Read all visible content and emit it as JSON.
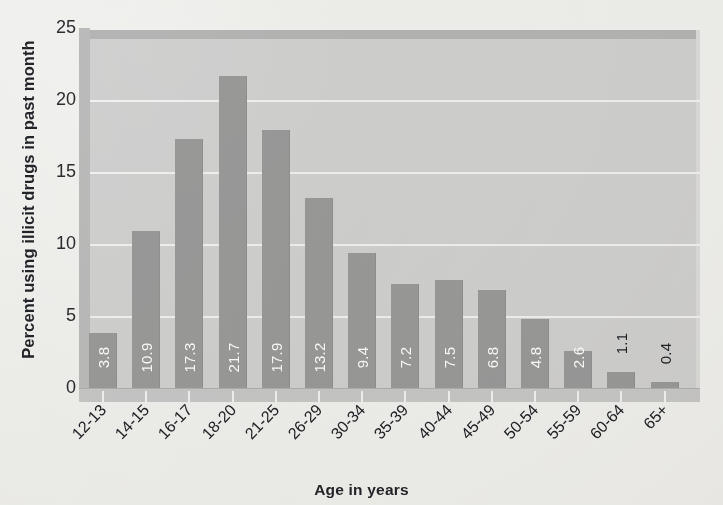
{
  "chart_data": {
    "type": "bar",
    "title": "",
    "subtitle": "",
    "xlabel": "Age in years",
    "ylabel": "Percent using illicit drugs in past month",
    "categories": [
      "12-13",
      "14-15",
      "16-17",
      "18-20",
      "21-25",
      "26-29",
      "30-34",
      "35-39",
      "40-44",
      "45-49",
      "50-54",
      "55-59",
      "60-64",
      "65+"
    ],
    "values": [
      3.8,
      10.9,
      17.3,
      21.7,
      17.9,
      13.2,
      9.4,
      7.2,
      7.5,
      6.8,
      4.8,
      2.6,
      1.1,
      0.4
    ],
    "value_labels": [
      "3.8",
      "10.9",
      "17.3",
      "21.7",
      "17.9",
      "13.2",
      "9.4",
      "7.2",
      "7.5",
      "6.8",
      "4.8",
      "2.6",
      "1.1",
      "0.4"
    ],
    "label_placement": [
      "inside",
      "inside",
      "inside",
      "inside",
      "inside",
      "inside",
      "inside",
      "inside",
      "inside",
      "inside",
      "inside",
      "inside",
      "outside",
      "outside"
    ],
    "ylim": [
      0,
      25
    ],
    "yticks": [
      0,
      5,
      10,
      15,
      20,
      25
    ],
    "ytick_labels": [
      "0",
      "5",
      "10",
      "15",
      "20",
      "25"
    ],
    "grid": "horizontal",
    "legend": "none",
    "colors": {
      "bar": "#9b9b9b",
      "plot_background": "#d2d2d2",
      "gridline": "#f3f3f3",
      "inside_label": "#ffffff",
      "outside_label": "#1f2024",
      "axis_text": "#222329",
      "page_background": "#f2f2f0"
    }
  }
}
